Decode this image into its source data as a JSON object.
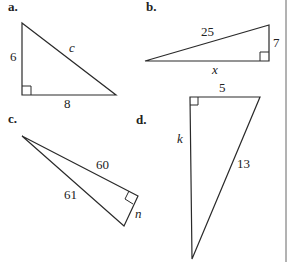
{
  "figure": {
    "panels": [
      {
        "id": "a",
        "label": "a.",
        "legs": [
          "6",
          "8"
        ],
        "hypotenuse": "c",
        "unknown": "c"
      },
      {
        "id": "b",
        "label": "b.",
        "legs": [
          "7",
          "x"
        ],
        "hypotenuse": "25",
        "unknown": "x"
      },
      {
        "id": "c",
        "label": "c.",
        "legs": [
          "60",
          "n"
        ],
        "hypotenuse": "61",
        "unknown": "n"
      },
      {
        "id": "d",
        "label": "d.",
        "legs": [
          "5",
          "k"
        ],
        "hypotenuse": "13",
        "unknown": "k"
      }
    ],
    "a": {
      "label": "a.",
      "side_left": "6",
      "side_bottom": "8",
      "hyp": "c"
    },
    "b": {
      "label": "b.",
      "hyp": "25",
      "side_right": "7",
      "side_bottom": "x"
    },
    "c": {
      "label": "c.",
      "leg_long": "60",
      "hyp": "61",
      "leg_short": "n"
    },
    "d": {
      "label": "d.",
      "side_top": "5",
      "side_left": "k",
      "hyp": "13"
    }
  },
  "colors": {
    "stroke": "#2a2a2a",
    "background": "#ffffff",
    "divider": "#555555"
  }
}
